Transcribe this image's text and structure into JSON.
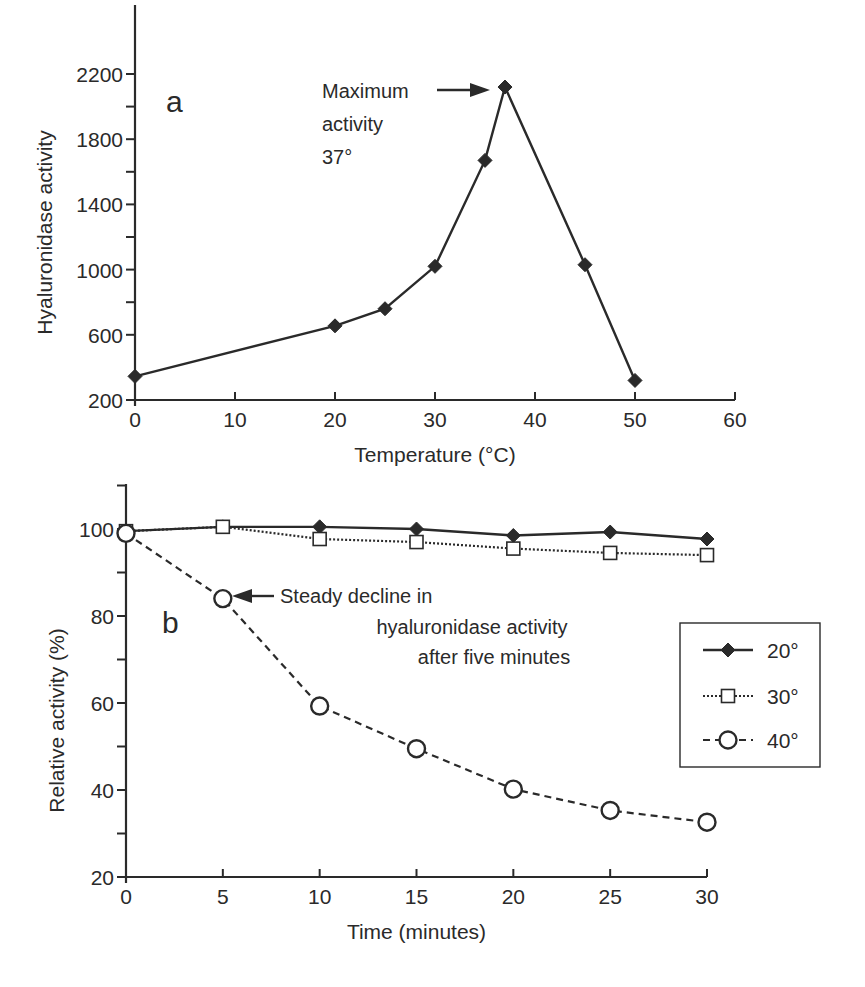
{
  "figure": {
    "panels": [
      "a",
      "b"
    ]
  },
  "chart_data": [
    {
      "id": "a",
      "type": "line",
      "panel_label": "a",
      "title": "",
      "xlabel": "Temperature (°C)",
      "ylabel": "Hyaluronidase activity",
      "xlim": [
        0,
        60
      ],
      "ylim": [
        200,
        2600
      ],
      "x_ticks": [
        0,
        10,
        20,
        30,
        40,
        50,
        60
      ],
      "y_ticks_labeled": [
        200,
        600,
        1000,
        1400,
        1800,
        2200
      ],
      "y_ticks_minor": [
        800,
        1200,
        1600,
        2000
      ],
      "grid": false,
      "legend": null,
      "series": [
        {
          "name": "Hyaluronidase activity",
          "marker": "filled-diamond",
          "line": "solid",
          "x": [
            0,
            20,
            25,
            30,
            35,
            37,
            45,
            50
          ],
          "y": [
            345,
            655,
            760,
            1020,
            1670,
            2120,
            1030,
            320
          ]
        }
      ],
      "annotations": [
        {
          "text_lines": [
            "Maximum",
            "activity",
            "37°"
          ],
          "arrow_to": [
            37,
            2120
          ]
        }
      ]
    },
    {
      "id": "b",
      "type": "line",
      "panel_label": "b",
      "title": "",
      "xlabel": "Time (minutes)",
      "ylabel": "Relative activity (%)",
      "xlim": [
        0,
        30
      ],
      "ylim": [
        20,
        110
      ],
      "x_ticks": [
        0,
        5,
        10,
        15,
        20,
        25,
        30
      ],
      "y_ticks_labeled": [
        20,
        40,
        60,
        80,
        100
      ],
      "y_ticks_minor": [
        30,
        50,
        70,
        90,
        110
      ],
      "grid": false,
      "legend": {
        "position": "right-middle",
        "entries": [
          "20°",
          "30°",
          "40°"
        ]
      },
      "series": [
        {
          "name": "20°",
          "marker": "filled-diamond",
          "line": "solid",
          "x": [
            0,
            5,
            10,
            15,
            20,
            25,
            30
          ],
          "y": [
            99.5,
            100.5,
            100.5,
            100,
            98.5,
            99.3,
            97.7
          ]
        },
        {
          "name": "30°",
          "marker": "open-square",
          "line": "dotted",
          "x": [
            0,
            5,
            10,
            15,
            20,
            25,
            30
          ],
          "y": [
            99.5,
            100.5,
            97.7,
            97,
            95.5,
            94.5,
            94
          ]
        },
        {
          "name": "40°",
          "marker": "open-circle",
          "line": "dashed",
          "x": [
            0,
            5,
            10,
            15,
            20,
            25,
            30
          ],
          "y": [
            99,
            84,
            59.3,
            49.5,
            40.2,
            35.3,
            32.6
          ]
        }
      ],
      "annotations": [
        {
          "text_lines": [
            "Steady decline in",
            "hyaluronidase activity",
            "after five minutes"
          ],
          "arrow_to": [
            5,
            84
          ]
        }
      ]
    }
  ],
  "layout": {
    "a": {
      "x0px": 135,
      "x1px": 735,
      "y0px": 400,
      "y1px": 74,
      "ylim_px_value": [
        200,
        2200
      ],
      "axis_top_px": 5
    },
    "b": {
      "x0px": 126,
      "x1px": 707,
      "y0px": 877,
      "y1px": 529,
      "ylim_px_value": [
        20,
        100
      ],
      "axis_top_px": 484
    }
  }
}
